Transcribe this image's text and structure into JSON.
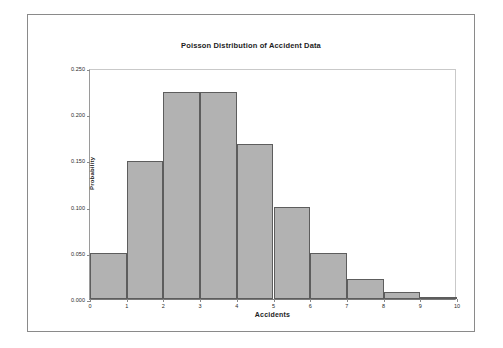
{
  "chart_data": {
    "type": "bar",
    "title": "Poisson Distribution of Accident Data",
    "xlabel": "Accidents",
    "ylabel": "Probability",
    "categories": [
      "0",
      "1",
      "2",
      "3",
      "4",
      "5",
      "6",
      "7",
      "8",
      "9"
    ],
    "values": [
      0.05,
      0.149,
      0.224,
      0.224,
      0.168,
      0.1,
      0.05,
      0.022,
      0.008,
      0.002
    ],
    "xlim": [
      0,
      10
    ],
    "ylim": [
      0.0,
      0.25
    ],
    "x_ticks": [
      "0",
      "1",
      "2",
      "3",
      "4",
      "5",
      "6",
      "7",
      "8",
      "9",
      "10"
    ],
    "y_ticks": [
      "0.000",
      "0.050",
      "0.100",
      "0.150",
      "0.200",
      "0.250"
    ],
    "grid": false,
    "legend": null,
    "bar_color": "#b2b2b2",
    "bar_border_color": "#5d5d5d",
    "background": "#ffffff"
  }
}
